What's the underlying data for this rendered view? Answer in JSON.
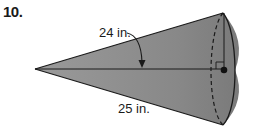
{
  "problem": {
    "number": "10."
  },
  "figure": {
    "type": "cone",
    "labels": {
      "upper_measure": "24 in.",
      "lower_measure": "25 in."
    },
    "colors": {
      "fill": "#8c8c8c",
      "fill_light": "#a6a6a6",
      "stroke": "#1a1a1a",
      "background": "#ffffff"
    }
  }
}
